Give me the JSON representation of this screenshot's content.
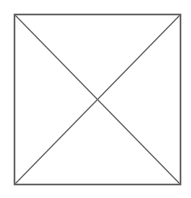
{
  "diagram": {
    "type": "square-with-diagonals",
    "background_color": "#ffffff",
    "stroke_color": "#555555",
    "square": {
      "x": 14.5,
      "y": 14.5,
      "width": 166,
      "height": 170,
      "stroke_width": 1.6
    },
    "diagonals": [
      {
        "x1": 14.5,
        "y1": 14.5,
        "x2": 180.5,
        "y2": 184.5
      },
      {
        "x1": 180.5,
        "y1": 14.5,
        "x2": 14.5,
        "y2": 184.5
      }
    ],
    "diagonal_stroke_color": "#666666",
    "diagonal_stroke_width": 1.2
  }
}
